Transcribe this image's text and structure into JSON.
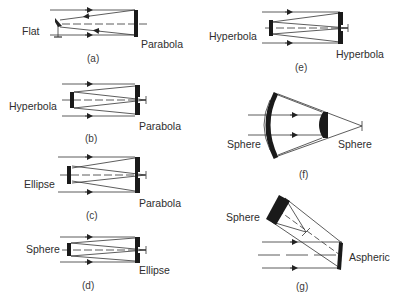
{
  "figure": {
    "panels": [
      {
        "id": "a",
        "caption": "(a)",
        "secondary_label": "Flat",
        "primary_label": "Parabola"
      },
      {
        "id": "b",
        "caption": "(b)",
        "secondary_label": "Hyperbola",
        "primary_label": "Parabola"
      },
      {
        "id": "c",
        "caption": "(c)",
        "secondary_label": "Ellipse",
        "primary_label": "Parabola"
      },
      {
        "id": "d",
        "caption": "(d)",
        "secondary_label": "Sphere",
        "primary_label": "Ellipse"
      },
      {
        "id": "e",
        "caption": "(e)",
        "secondary_label": "Hyperbola",
        "primary_label": "Hyperbola"
      },
      {
        "id": "f",
        "caption": "(f)",
        "secondary_label": "Sphere",
        "primary_label": "Sphere"
      },
      {
        "id": "g",
        "caption": "(g)",
        "secondary_label": "Sphere",
        "primary_label": "Aspheric"
      }
    ]
  },
  "colors": {
    "line": "#333333",
    "mirror": "#1a1a1a",
    "text": "#2e2e2e"
  }
}
